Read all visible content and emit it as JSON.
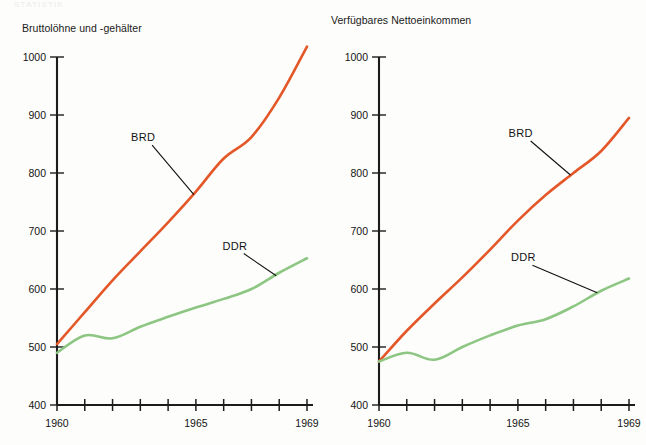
{
  "page": {
    "faint_top_text": "STATISTIK",
    "background": "#fdfdfb",
    "width": 646,
    "height": 445
  },
  "colors": {
    "brd": "#e35728",
    "ddr": "#8cc682",
    "axis": "#1c1c1c",
    "text": "#141414"
  },
  "chart_data": [
    {
      "type": "line",
      "title": "Bruttolöhne und -gehälter",
      "xlabel": "",
      "ylabel": "",
      "x": [
        1960,
        1961,
        1962,
        1963,
        1964,
        1965,
        1966,
        1967,
        1968,
        1969
      ],
      "xticks": [
        1960,
        1961,
        1962,
        1963,
        1964,
        1965,
        1966,
        1967,
        1968,
        1969
      ],
      "xtick_labels": [
        "1960",
        "",
        "",
        "",
        "",
        "1965",
        "",
        "",
        "",
        "1969"
      ],
      "xlim": [
        1960,
        1969
      ],
      "yticks": [
        400,
        500,
        600,
        700,
        800,
        900,
        1000
      ],
      "ytick_labels": [
        "400",
        "500",
        "600",
        "700",
        "800",
        "900",
        "1000"
      ],
      "ylim": [
        400,
        1000
      ],
      "grid": false,
      "legend": "inline-annotations",
      "series": [
        {
          "name": "BRD",
          "color": "#e35728",
          "values": [
            505,
            560,
            615,
            665,
            715,
            768,
            825,
            862,
            930,
            1018
          ],
          "label_x": 1963.1,
          "label_y": 855
        },
        {
          "name": "DDR",
          "color": "#8cc682",
          "values": [
            490,
            520,
            515,
            535,
            552,
            568,
            583,
            600,
            628,
            653
          ],
          "label_x": 1966.4,
          "label_y": 668
        }
      ]
    },
    {
      "type": "line",
      "title": "Verfügbares Nettoeinkommen",
      "xlabel": "",
      "ylabel": "",
      "x": [
        1960,
        1961,
        1962,
        1963,
        1964,
        1965,
        1966,
        1967,
        1968,
        1969
      ],
      "xticks": [
        1960,
        1961,
        1962,
        1963,
        1964,
        1965,
        1966,
        1967,
        1968,
        1969
      ],
      "xtick_labels": [
        "1960",
        "",
        "",
        "",
        "",
        "1965",
        "",
        "",
        "",
        "1969"
      ],
      "xlim": [
        1960,
        1969
      ],
      "yticks": [
        400,
        500,
        600,
        700,
        800,
        900,
        1000
      ],
      "ytick_labels": [
        "400",
        "500",
        "600",
        "700",
        "800",
        "900",
        "1000"
      ],
      "ylim": [
        400,
        1000
      ],
      "grid": false,
      "legend": "inline-annotations",
      "series": [
        {
          "name": "BRD",
          "color": "#e35728",
          "values": [
            475,
            528,
            575,
            620,
            668,
            718,
            762,
            800,
            838,
            895
          ],
          "label_x": 1965.1,
          "label_y": 862
        },
        {
          "name": "DDR",
          "color": "#8cc682",
          "values": [
            475,
            490,
            478,
            500,
            520,
            537,
            548,
            570,
            597,
            618
          ],
          "label_x": 1965.2,
          "label_y": 648
        }
      ]
    }
  ]
}
